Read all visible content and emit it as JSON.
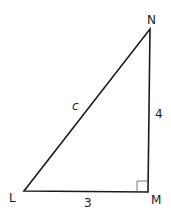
{
  "diagram": {
    "type": "right-triangle",
    "stroke_color": "#1a1a1a",
    "vertices": {
      "L": {
        "label": "L"
      },
      "M": {
        "label": "M"
      },
      "N": {
        "label": "N"
      }
    },
    "sides": {
      "LM": {
        "label": "3"
      },
      "MN": {
        "label": "4"
      },
      "LN": {
        "label": "c"
      }
    },
    "right_angle_at": "M"
  }
}
